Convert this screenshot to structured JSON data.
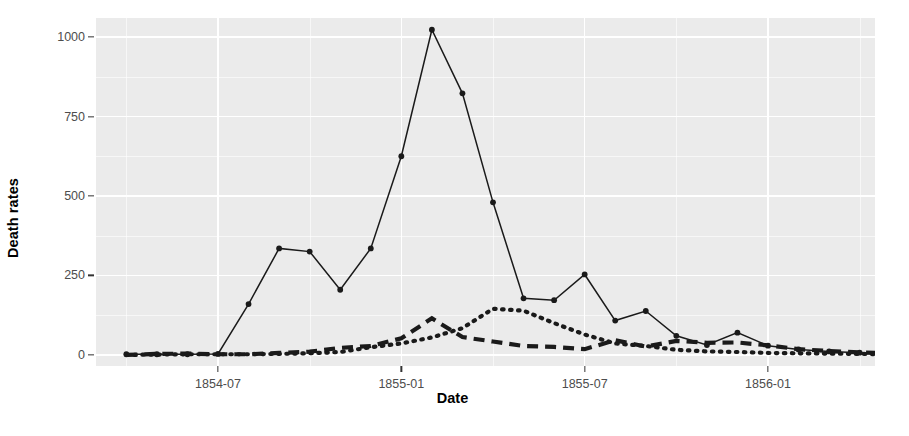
{
  "chart_data": {
    "type": "line",
    "title": "",
    "xlabel": "Date",
    "ylabel": "Death rates",
    "ylim": [
      -35,
      1060
    ],
    "yticks": [
      0,
      250,
      500,
      750,
      1000
    ],
    "yticklabels": [
      "0",
      "250",
      "500",
      "750",
      "1000"
    ],
    "xticklabels": [
      "1854-07",
      "1855-01",
      "1855-07",
      "1856-01"
    ],
    "xtickvalues": [
      "1854-07-01",
      "1855-01-01",
      "1855-07-01",
      "1856-01-01"
    ],
    "xlim": [
      "1854-03-20",
      "1856-04-25"
    ],
    "grid": true,
    "legend": "none",
    "x": [
      "1854-04",
      "1854-05",
      "1854-06",
      "1854-07",
      "1854-08",
      "1854-09",
      "1854-10",
      "1854-11",
      "1854-12",
      "1855-01",
      "1855-02",
      "1855-03",
      "1855-04",
      "1855-05",
      "1855-06",
      "1855-07",
      "1855-08",
      "1855-09",
      "1855-10",
      "1855-11",
      "1855-12",
      "1856-01",
      "1856-02",
      "1856-03"
    ],
    "series": [
      {
        "name": "Disease",
        "linestyle": "solid",
        "color": "#1a1a1a",
        "markers": true,
        "values": [
          1,
          12,
          11,
          359,
          828,
          788,
          503,
          844,
          1725,
          2761,
          2120,
          1205,
          477,
          508,
          802,
          382,
          483,
          189,
          128,
          178,
          91,
          42,
          24,
          15
        ]
      },
      {
        "name": "Wounds",
        "linestyle": "dashed",
        "color": "#333333",
        "markers": false,
        "values": [
          0,
          0,
          0,
          0,
          1,
          81,
          132,
          287,
          114,
          83,
          42,
          32,
          48,
          49,
          209,
          134,
          164,
          276,
          53,
          33,
          18,
          10,
          6,
          2
        ]
      },
      {
        "name": "Other",
        "linestyle": "dotted",
        "color": "#333333",
        "markers": false,
        "values": [
          5,
          9,
          6,
          23,
          30,
          70,
          128,
          106,
          131,
          324,
          361,
          172,
          57,
          37,
          31,
          33,
          25,
          20,
          18,
          32,
          28,
          4,
          0,
          0
        ]
      }
    ],
    "plotted_rates": {
      "description": "Values as plotted on the Death rates axis",
      "solid_line": [
        2,
        2,
        2,
        3,
        160,
        335,
        325,
        205,
        335,
        625,
        1023,
        823,
        480,
        178,
        172,
        253,
        108,
        138,
        60,
        31,
        70,
        29,
        17,
        11,
        7,
        4,
        3
      ],
      "dashed_line": [
        0,
        3,
        4,
        2,
        2,
        6,
        10,
        22,
        28,
        52,
        115,
        56,
        42,
        28,
        25,
        18,
        46,
        26,
        44,
        38,
        39,
        30,
        18,
        12,
        8,
        5,
        3
      ],
      "dotted_line": [
        0,
        1,
        2,
        2,
        2,
        3,
        5,
        9,
        24,
        36,
        55,
        84,
        145,
        139,
        100,
        64,
        36,
        28,
        16,
        11,
        9,
        6,
        5,
        4,
        3,
        2,
        1
      ]
    }
  },
  "axis": {
    "y_title": "Death rates",
    "x_title": "Date"
  },
  "theme": {
    "panel_fill": "#ebebeb",
    "grid_color": "#ffffff",
    "tick_label_color": "#4d4d4d",
    "line_color": "#1a1a1a",
    "background": "#ffffff"
  }
}
